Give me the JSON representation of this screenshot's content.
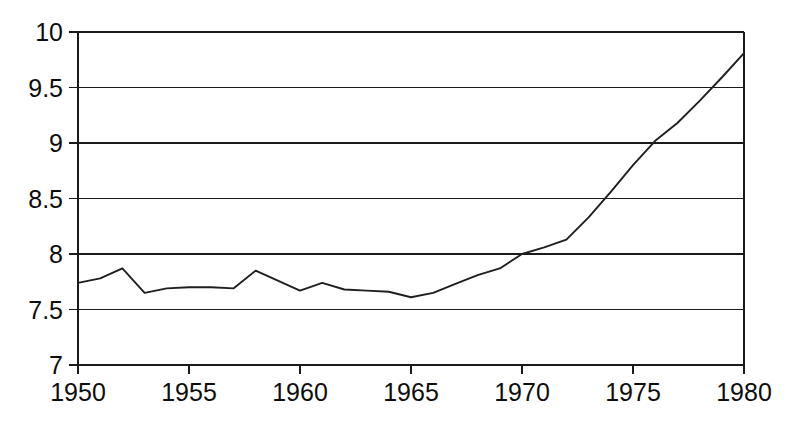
{
  "chart_data": {
    "type": "line",
    "title": "",
    "subtitle": "",
    "xlabel": "",
    "ylabel": "",
    "xlim": [
      1950,
      1980
    ],
    "ylim": [
      7,
      10
    ],
    "grid": "horizontal",
    "legend": "none",
    "x_tick_labels": [
      "1950",
      "1955",
      "1960",
      "1965",
      "1970",
      "1975",
      "1980"
    ],
    "x_ticks": [
      1950,
      1955,
      1960,
      1965,
      1970,
      1975,
      1980
    ],
    "y_tick_labels": [
      "7",
      "7.5",
      "8",
      "8.5",
      "9",
      "9.5",
      "10"
    ],
    "y_ticks": [
      7,
      7.5,
      8,
      8.5,
      9,
      9.5,
      10
    ],
    "series": [
      {
        "name": "series-1",
        "color": "#1f1f1f",
        "x": [
          1950,
          1951,
          1952,
          1953,
          1954,
          1955,
          1956,
          1957,
          1958,
          1959,
          1960,
          1961,
          1962,
          1963,
          1964,
          1965,
          1966,
          1967,
          1968,
          1969,
          1970,
          1971,
          1972,
          1973,
          1974,
          1975,
          1976,
          1977,
          1978,
          1979,
          1980
        ],
        "values": [
          7.74,
          7.78,
          7.87,
          7.65,
          7.69,
          7.7,
          7.7,
          7.69,
          7.85,
          7.76,
          7.67,
          7.74,
          7.68,
          7.67,
          7.66,
          7.61,
          7.65,
          7.73,
          7.81,
          7.87,
          8.0,
          8.06,
          8.13,
          8.33,
          8.56,
          8.8,
          9.02,
          9.18,
          9.38,
          9.59,
          9.81
        ]
      }
    ],
    "annotations": []
  },
  "layout": {
    "plot_left": 78,
    "plot_right": 744,
    "plot_top": 32,
    "plot_bottom": 365,
    "canvas_width": 792,
    "canvas_height": 427
  },
  "colors": {
    "background": "#ffffff",
    "axis": "#1a1a1a",
    "grid": "#1a1a1a",
    "series": "#1f1f1f",
    "text": "#0d0d0d"
  }
}
